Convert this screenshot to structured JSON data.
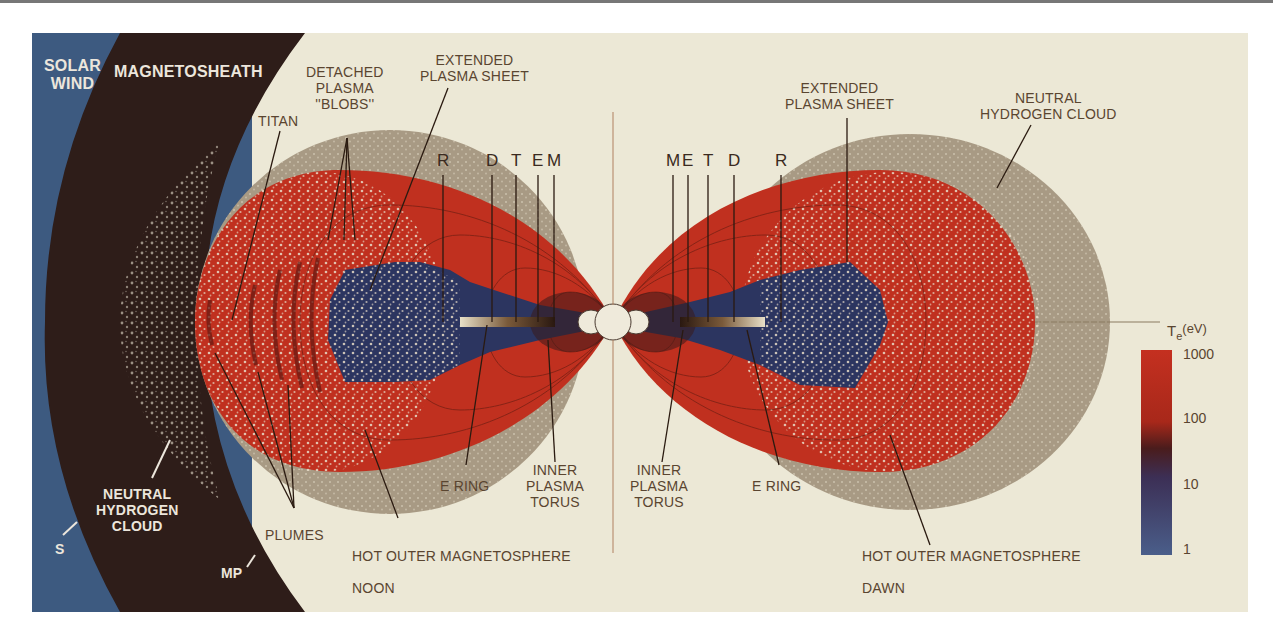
{
  "figure": {
    "colors": {
      "solar_wind": "#3d5a80",
      "magnetosheath": "#2e1d19",
      "background": "#ece8d6",
      "neutral_cloud": "#a89a84",
      "hot_magnetosphere": "#c0301f",
      "inner_plasma": "#2c3560",
      "saturn": "#efeadb",
      "label_text": "#5a4530"
    },
    "regions": {
      "solar_wind": "SOLAR\nWIND",
      "magnetosheath": "MAGNETOSHEATH",
      "sw_boundary_marker": "S",
      "mp_boundary_marker": "MP",
      "neutral_cloud_left": "NEUTRAL\nHYDROGEN\nCLOUD"
    },
    "left_labels": {
      "titan": "TITAN",
      "blobs": "DETACHED\nPLASMA\n''BLOBS''",
      "plasma_sheet": "EXTENDED\nPLASMA SHEET",
      "plumes": "PLUMES",
      "e_ring": "E RING",
      "inner_torus": "INNER\nPLASMA\nTORUS",
      "hot_outer": "HOT OUTER MAGNETOSPHERE",
      "side": "NOON"
    },
    "right_labels": {
      "plasma_sheet": "EXTENDED\nPLASMA SHEET",
      "neutral_cloud": "NEUTRAL\nHYDROGEN CLOUD",
      "inner_torus": "INNER\nPLASMA\nTORUS",
      "e_ring": "E RING",
      "hot_outer": "HOT OUTER MAGNETOSPHERE",
      "side": "DAWN"
    },
    "moons_left": [
      "R",
      "D",
      "T",
      "E",
      "M"
    ],
    "moons_right": [
      "M",
      "E",
      "T",
      "D",
      "R"
    ],
    "colorbar": {
      "title": "T",
      "title_sub": "e",
      "title_unit": "(eV)",
      "ticks": [
        "1000",
        "100",
        "10",
        "1"
      ]
    }
  }
}
